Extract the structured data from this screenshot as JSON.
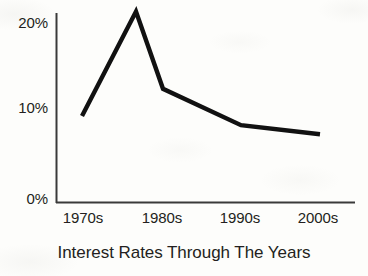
{
  "chart_data": {
    "type": "line",
    "title": "Interest Rates Through The Years",
    "xlabel": "",
    "ylabel": "",
    "categories": [
      "1970s",
      "1980s",
      "1990s",
      "2000s"
    ],
    "series": [
      {
        "name": "Interest Rate",
        "values": [
          9,
          12,
          8,
          7
        ],
        "color": "#111111"
      }
    ],
    "annotations": [
      {
        "label": "peak",
        "x_between": [
          "1970s",
          "1980s"
        ],
        "value": 20.5
      }
    ],
    "vertices": [
      {
        "x_label": "1970s",
        "value": 9
      },
      {
        "x_label": "peak",
        "value": 20.5
      },
      {
        "x_label": "1980s",
        "value": 12
      },
      {
        "x_label": "1990s",
        "value": 8
      },
      {
        "x_label": "2000s",
        "value": 7
      }
    ],
    "ytick_labels": [
      "20%",
      "10%",
      "0%"
    ],
    "ytick_values": [
      20,
      10,
      0
    ],
    "ylim": [
      0,
      22
    ],
    "grid": false,
    "legend": "none",
    "line_width": 4,
    "background_color": "#fdfdfb",
    "axis_color": "#3a3a3a"
  },
  "yaxis": {
    "tick_20": "20%",
    "tick_10": "10%",
    "tick_0": "0%"
  },
  "xaxis": {
    "tick_1970s": "1970s",
    "tick_1980s": "1980s",
    "tick_1990s": "1990s",
    "tick_2000s": "2000s"
  },
  "title": "Interest Rates Through The Years"
}
